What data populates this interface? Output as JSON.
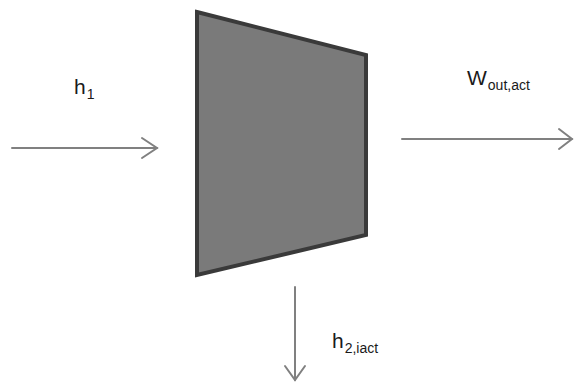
{
  "diagram": {
    "title": "",
    "component": {
      "name": "turbine",
      "shape": "trapezoid",
      "points": [
        [
          197,
          12
        ],
        [
          366,
          55
        ],
        [
          366,
          235
        ],
        [
          197,
          275
        ]
      ],
      "fill": "#7a7a7a",
      "stroke": "#3a3a3a"
    },
    "arrows": [
      {
        "id": "inlet",
        "from": [
          12,
          148
        ],
        "to": [
          157,
          148
        ],
        "direction": "right",
        "color": "#808080"
      },
      {
        "id": "work-out",
        "from": [
          402,
          139
        ],
        "to": [
          572,
          139
        ],
        "direction": "right",
        "color": "#808080"
      },
      {
        "id": "outlet",
        "from": [
          295,
          287
        ],
        "to": [
          295,
          380
        ],
        "direction": "down",
        "color": "#808080"
      }
    ],
    "labels": {
      "h1": {
        "main": "h",
        "sub": "1"
      },
      "wout": {
        "main": "W",
        "sub": "out,act"
      },
      "h2": {
        "main": "h",
        "sub": "2,iact"
      }
    }
  }
}
